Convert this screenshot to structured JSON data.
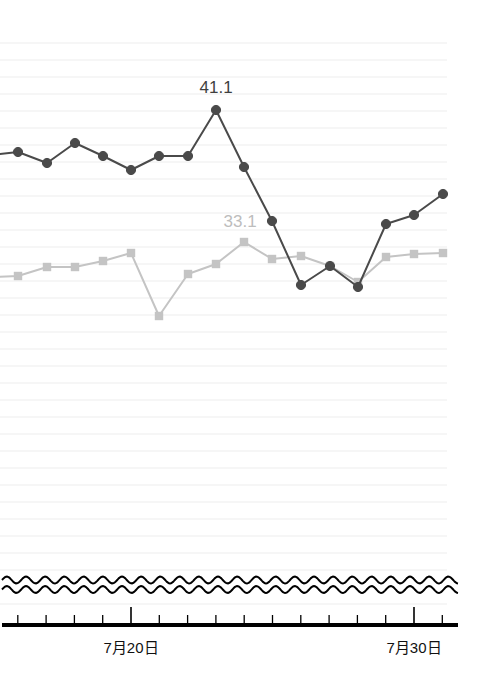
{
  "chart_data": {
    "type": "line",
    "title": "",
    "subtitle": "",
    "xlabel": "",
    "ylabel": "",
    "grid": true,
    "legend_position": "none",
    "axis_break": true,
    "x_tick_labels": [
      "7月20日",
      "7月30日"
    ],
    "x_tick_label_positions": [
      131,
      414
    ],
    "x_axis_start_day": 15,
    "x_axis_end_day": 31,
    "categories": [
      15,
      16,
      17,
      18,
      19,
      20,
      21,
      22,
      23,
      24,
      25,
      26,
      27,
      28,
      29,
      30,
      31
    ],
    "ylim": [
      20.0,
      48.0
    ],
    "grid_step": 1.0,
    "series": [
      {
        "name": "dark-series",
        "color": "#4a4a4a",
        "marker": "circle",
        "values": [
          38.6,
          38.7,
          38.0,
          39.6,
          38.5,
          37.3,
          38.4,
          38.4,
          41.1,
          37.6,
          34.3,
          30.4,
          31.5,
          30.3,
          34.1,
          34.6,
          35.8
        ],
        "x_pixels": [
          -10,
          18,
          47,
          75,
          103,
          131,
          159,
          188,
          216,
          244,
          272,
          301,
          330,
          358,
          386,
          414,
          443
        ],
        "y_pixels": [
          155,
          152,
          163,
          143,
          156,
          170,
          156,
          156,
          110,
          167,
          221,
          285,
          266,
          287,
          224,
          215,
          194
        ],
        "labeled_point": {
          "index": 8,
          "value": "41.1",
          "x": 216,
          "y": 110
        }
      },
      {
        "name": "light-series",
        "color": "#c4c4c4",
        "marker": "square",
        "values": [
          30.9,
          31.1,
          31.6,
          31.6,
          32.0,
          32.5,
          28.7,
          31.2,
          31.8,
          33.1,
          32.1,
          32.3,
          31.6,
          30.6,
          32.1,
          32.4,
          32.5
        ],
        "x_pixels": [
          -10,
          18,
          47,
          75,
          103,
          131,
          159,
          188,
          216,
          244,
          272,
          301,
          330,
          358,
          386,
          414,
          443
        ],
        "y_pixels": [
          277,
          276,
          267,
          267,
          261,
          253,
          316,
          274,
          264,
          242,
          259,
          256,
          266,
          282,
          257,
          254,
          253
        ],
        "labeled_point": {
          "index": 9,
          "value": "33.1",
          "x": 244,
          "y": 242
        }
      }
    ],
    "annotations": [
      {
        "text": "41.1",
        "series": "dark-series",
        "x": 216,
        "y": 110,
        "color": "#3f3f3f"
      },
      {
        "text": "33.1",
        "series": "light-series",
        "x": 244,
        "y": 242,
        "color": "#bdbdbd"
      }
    ]
  },
  "axis": {
    "tick_label_left": "7月20日",
    "tick_label_right": "7月30日"
  },
  "colors": {
    "dark_series": "#4a4a4a",
    "light_series": "#c4c4c4",
    "gridline": "#ededed",
    "axis": "#000000",
    "background": "#ffffff"
  }
}
